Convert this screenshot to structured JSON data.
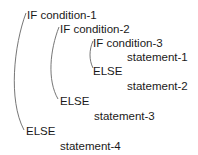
{
  "diagram": {
    "type": "nested-if-else-pseudocode",
    "lines": [
      {
        "text": "IF  condition-1",
        "x": 26,
        "y": 9
      },
      {
        "text": "IF  condition-2",
        "x": 59,
        "y": 23
      },
      {
        "text": "IF  condition-3",
        "x": 92,
        "y": 37
      },
      {
        "text": "statement-1",
        "x": 127,
        "y": 51
      },
      {
        "text": "ELSE",
        "x": 93,
        "y": 65
      },
      {
        "text": "statement-2",
        "x": 127,
        "y": 80
      },
      {
        "text": "ELSE",
        "x": 60,
        "y": 95
      },
      {
        "text": "statement-3",
        "x": 94,
        "y": 110
      },
      {
        "text": "ELSE",
        "x": 26,
        "y": 125
      },
      {
        "text": "statement-4",
        "x": 60,
        "y": 140
      }
    ],
    "connector_color": "#555555"
  }
}
